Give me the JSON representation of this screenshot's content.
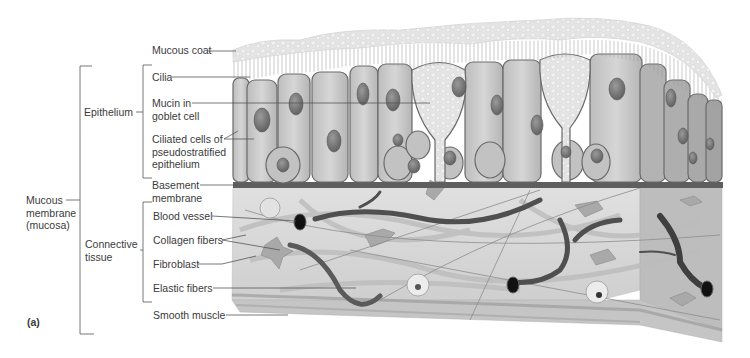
{
  "figure": {
    "panel_label": "(a)"
  },
  "labels": {
    "mucous_coat": "Mucous coat",
    "cilia": "Cilia",
    "mucin_line1": "Mucin in",
    "mucin_line2": "goblet cell",
    "ciliated_line1": "Ciliated cells of",
    "ciliated_line2": "pseudostratified",
    "ciliated_line3": "epithelium",
    "basement_line1": "Basement",
    "basement_line2": "membrane",
    "blood_vessel": "Blood vessel",
    "collagen_fibers": "Collagen fibers",
    "fibroblast": "Fibroblast",
    "elastic_fibers": "Elastic fibers",
    "smooth_muscle": "Smooth muscle"
  },
  "groups": {
    "epithelium": "Epithelium",
    "connective_line1": "Connective",
    "connective_line2": "tissue",
    "mucosa_line1": "Mucous",
    "mucosa_line2": "membrane",
    "mucosa_line3": "(mucosa)"
  },
  "colors": {
    "background": "#ffffff",
    "label_text": "#3b3b3b",
    "leader_line": "#555555",
    "cell_fill": "#cfcfcf",
    "cell_outline": "#6a6a6a",
    "nucleus": "#7d7d7d",
    "mucus": "#e6e6e6",
    "basement": "#5e5e5e",
    "connective_fill": "#d9d9d9",
    "vessel": "#555555"
  }
}
